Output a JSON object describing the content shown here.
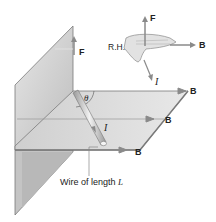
{
  "diagram": {
    "labels": {
      "force_plate": "F",
      "force_hand": "F",
      "right_hand": "R.H.",
      "field_hand": "B",
      "current_hand": "I",
      "field_top": "B",
      "field_mid": "B",
      "field_bottom": "B",
      "current_wire": "I",
      "angle": "θ",
      "wire_caption": "Wire of length",
      "wire_length_symbol": "L"
    },
    "colors": {
      "plate_fill": "#d6d6d6",
      "plate_edge": "#7a7a7a",
      "arrow": "#8a8a8a",
      "text": "#222222",
      "background": "#ffffff"
    }
  }
}
